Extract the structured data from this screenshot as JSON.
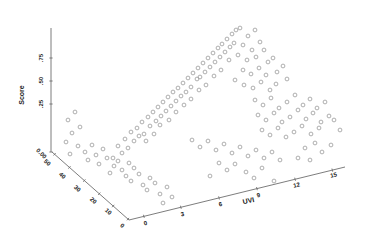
{
  "figure": {
    "background": "#ffffff"
  },
  "colors": {
    "axis_line": "#6e6e6e",
    "tick_text": "#1a1a1a",
    "point_stroke": "#9a9a9a"
  },
  "chart_data": {
    "type": "scatter",
    "projection": "3d",
    "title": "",
    "zlabel": "Score",
    "xlabel": "UVI",
    "ylabel": "",
    "z_range": [
      0,
      0.75
    ],
    "x_range": [
      0,
      15
    ],
    "y_range": [
      0,
      50
    ],
    "grid": false,
    "legend": "none",
    "marker": {
      "shape": "open-circle",
      "color": "#9a9a9a",
      "radius": 1.9
    },
    "axes": {
      "z": {
        "label": "Score",
        "label_pos": [
          24,
          95
        ],
        "label_rot": -90,
        "line": [
          51,
          28,
          51,
          152
        ],
        "ticks": [
          {
            "t": "0.00",
            "x": 40,
            "y": 155,
            "r": 45
          },
          {
            "t": ".25",
            "x": 43,
            "y": 104,
            "r": -90
          },
          {
            "t": ".50",
            "x": 43,
            "y": 81,
            "r": -90
          },
          {
            "t": ".75",
            "x": 43,
            "y": 58,
            "r": -90
          }
        ]
      },
      "y": {
        "label": "",
        "label_pos": [
          0,
          0
        ],
        "label_rot": 0,
        "line": [
          52,
          152,
          129,
          220
        ],
        "ticks": [
          {
            "t": "50",
            "x": 46,
            "y": 164,
            "r": 42
          },
          {
            "t": "40",
            "x": 61,
            "y": 177,
            "r": 42
          },
          {
            "t": "30",
            "x": 76,
            "y": 190,
            "r": 42
          },
          {
            "t": "20",
            "x": 92,
            "y": 202,
            "r": 42
          },
          {
            "t": "10",
            "x": 107,
            "y": 213,
            "r": 42
          },
          {
            "t": "0",
            "x": 121,
            "y": 227,
            "r": 42
          }
        ]
      },
      "x": {
        "label": "UVI",
        "label_pos": [
          249,
          203
        ],
        "label_rot": -13,
        "line": [
          129,
          220,
          345,
          167
        ],
        "ticks": [
          {
            "t": "0",
            "x": 146,
            "y": 225,
            "r": -13
          },
          {
            "t": "3",
            "x": 183,
            "y": 216,
            "r": -13
          },
          {
            "t": "6",
            "x": 221,
            "y": 206,
            "r": -13
          },
          {
            "t": "9",
            "x": 259,
            "y": 197,
            "r": -13
          },
          {
            "t": "12",
            "x": 297,
            "y": 187,
            "r": -13
          },
          {
            "t": "15",
            "x": 334,
            "y": 177,
            "r": -13
          }
        ]
      }
    },
    "points_px": [
      [
        113,
        158
      ],
      [
        118,
        146
      ],
      [
        122,
        153
      ],
      [
        125,
        139
      ],
      [
        128,
        148
      ],
      [
        131,
        132
      ],
      [
        134,
        141
      ],
      [
        137,
        128
      ],
      [
        139,
        136
      ],
      [
        142,
        122
      ],
      [
        144,
        134
      ],
      [
        148,
        117
      ],
      [
        150,
        126
      ],
      [
        153,
        112
      ],
      [
        156,
        121
      ],
      [
        158,
        107
      ],
      [
        161,
        116
      ],
      [
        163,
        102
      ],
      [
        166,
        111
      ],
      [
        168,
        97
      ],
      [
        171,
        106
      ],
      [
        173,
        92
      ],
      [
        176,
        101
      ],
      [
        178,
        88
      ],
      [
        181,
        96
      ],
      [
        183,
        83
      ],
      [
        186,
        92
      ],
      [
        188,
        78
      ],
      [
        191,
        87
      ],
      [
        193,
        73
      ],
      [
        197,
        79
      ],
      [
        198,
        68
      ],
      [
        200,
        77
      ],
      [
        203,
        63
      ],
      [
        205,
        72
      ],
      [
        208,
        58
      ],
      [
        210,
        67
      ],
      [
        213,
        53
      ],
      [
        215,
        62
      ],
      [
        218,
        48
      ],
      [
        220,
        57
      ],
      [
        222,
        44
      ],
      [
        225,
        52
      ],
      [
        227,
        39
      ],
      [
        230,
        47
      ],
      [
        232,
        34
      ],
      [
        234,
        43
      ],
      [
        236,
        30
      ],
      [
        229,
        60
      ],
      [
        221,
        70
      ],
      [
        214,
        76
      ],
      [
        206,
        85
      ],
      [
        199,
        90
      ],
      [
        191,
        99
      ],
      [
        184,
        105
      ],
      [
        176,
        112
      ],
      [
        169,
        120
      ],
      [
        160,
        125
      ],
      [
        154,
        134
      ],
      [
        146,
        141
      ],
      [
        240,
        28
      ],
      [
        248,
        36
      ],
      [
        255,
        30
      ],
      [
        243,
        45
      ],
      [
        252,
        50
      ],
      [
        260,
        42
      ],
      [
        238,
        55
      ],
      [
        247,
        60
      ],
      [
        256,
        57
      ],
      [
        264,
        50
      ],
      [
        268,
        62
      ],
      [
        243,
        70
      ],
      [
        251,
        74
      ],
      [
        259,
        68
      ],
      [
        266,
        75
      ],
      [
        273,
        58
      ],
      [
        235,
        80
      ],
      [
        244,
        85
      ],
      [
        253,
        88
      ],
      [
        261,
        82
      ],
      [
        270,
        90
      ],
      [
        277,
        72
      ],
      [
        283,
        66
      ],
      [
        276,
        84
      ],
      [
        287,
        79
      ],
      [
        255,
        100
      ],
      [
        263,
        105
      ],
      [
        271,
        98
      ],
      [
        279,
        108
      ],
      [
        287,
        102
      ],
      [
        295,
        95
      ],
      [
        303,
        105
      ],
      [
        310,
        99
      ],
      [
        317,
        108
      ],
      [
        325,
        102
      ],
      [
        258,
        115
      ],
      [
        266,
        120
      ],
      [
        274,
        113
      ],
      [
        282,
        122
      ],
      [
        290,
        117
      ],
      [
        298,
        110
      ],
      [
        306,
        119
      ],
      [
        313,
        113
      ],
      [
        321,
        122
      ],
      [
        329,
        116
      ],
      [
        262,
        130
      ],
      [
        270,
        135
      ],
      [
        278,
        128
      ],
      [
        286,
        137
      ],
      [
        294,
        132
      ],
      [
        302,
        126
      ],
      [
        311,
        134
      ],
      [
        319,
        128
      ],
      [
        334,
        120
      ],
      [
        340,
        130
      ],
      [
        305,
        148
      ],
      [
        315,
        143
      ],
      [
        322,
        152
      ],
      [
        331,
        145
      ],
      [
        298,
        158
      ],
      [
        310,
        160
      ],
      [
        78,
        146
      ],
      [
        85,
        152
      ],
      [
        92,
        145
      ],
      [
        88,
        160
      ],
      [
        96,
        155
      ],
      [
        103,
        149
      ],
      [
        99,
        164
      ],
      [
        107,
        158
      ],
      [
        114,
        166
      ],
      [
        110,
        173
      ],
      [
        118,
        161
      ],
      [
        122,
        170
      ],
      [
        129,
        163
      ],
      [
        126,
        176
      ],
      [
        134,
        168
      ],
      [
        131,
        181
      ],
      [
        139,
        174
      ],
      [
        143,
        185
      ],
      [
        150,
        178
      ],
      [
        147,
        190
      ],
      [
        155,
        183
      ],
      [
        160,
        194
      ],
      [
        167,
        187
      ],
      [
        172,
        197
      ],
      [
        163,
        203
      ],
      [
        192,
        140
      ],
      [
        200,
        147
      ],
      [
        208,
        141
      ],
      [
        216,
        150
      ],
      [
        224,
        144
      ],
      [
        232,
        153
      ],
      [
        240,
        147
      ],
      [
        248,
        156
      ],
      [
        256,
        150
      ],
      [
        264,
        158
      ],
      [
        272,
        152
      ],
      [
        280,
        160
      ],
      [
        219,
        163
      ],
      [
        227,
        170
      ],
      [
        235,
        164
      ],
      [
        246,
        172
      ],
      [
        210,
        176
      ],
      [
        254,
        178
      ],
      [
        262,
        168
      ],
      [
        274,
        181
      ],
      [
        68,
        120
      ],
      [
        72,
        133
      ],
      [
        66,
        142
      ],
      [
        75,
        112
      ],
      [
        80,
        127
      ],
      [
        70,
        154
      ]
    ]
  }
}
